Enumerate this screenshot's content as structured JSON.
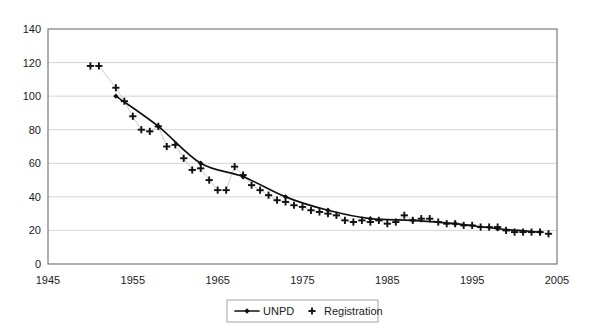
{
  "chart_data": {
    "type": "line",
    "title": "",
    "subtitle": "",
    "xlabel": "",
    "ylabel": "",
    "xlim": [
      1945,
      2005
    ],
    "ylim": [
      0,
      140
    ],
    "xticks": [
      1945,
      1955,
      1965,
      1975,
      1985,
      1995,
      2005
    ],
    "yticks": [
      0,
      20,
      40,
      60,
      80,
      100,
      120,
      140
    ],
    "grid": "horizontal",
    "legend_position": "bottom-center",
    "series": [
      {
        "name": "UNPD",
        "marker": "filled-diamond-line",
        "x": [
          1953,
          1958,
          1963,
          1968,
          1973,
          1978,
          1983,
          1988,
          1993,
          1998,
          2003
        ],
        "values": [
          100,
          82,
          60,
          52,
          40,
          32,
          27,
          26,
          24,
          21,
          19
        ]
      },
      {
        "name": "Registration",
        "marker": "plus",
        "x": [
          1950,
          1951,
          1953,
          1954,
          1955,
          1956,
          1957,
          1958,
          1959,
          1960,
          1961,
          1962,
          1963,
          1964,
          1965,
          1966,
          1967,
          1968,
          1969,
          1970,
          1971,
          1972,
          1973,
          1974,
          1975,
          1976,
          1977,
          1978,
          1979,
          1980,
          1981,
          1982,
          1983,
          1984,
          1985,
          1986,
          1987,
          1988,
          1989,
          1990,
          1991,
          1992,
          1993,
          1994,
          1995,
          1996,
          1997,
          1998,
          1999,
          2000,
          2001,
          2002,
          2003,
          2004
        ],
        "values": [
          118,
          118,
          105,
          97,
          88,
          80,
          79,
          82,
          70,
          71,
          63,
          56,
          57,
          50,
          44,
          44,
          58,
          53,
          47,
          44,
          41,
          38,
          37,
          35,
          34,
          32,
          31,
          30,
          29,
          26,
          25,
          26,
          25,
          26,
          24,
          25,
          29,
          26,
          27,
          27,
          25,
          24,
          24,
          23,
          23,
          22,
          22,
          22,
          20,
          19,
          19,
          19,
          19,
          18
        ]
      }
    ]
  },
  "legend": {
    "items": [
      {
        "label": "UNPD",
        "marker": "line-with-diamond"
      },
      {
        "label": "Registration",
        "marker": "plus"
      }
    ]
  },
  "axes": {
    "y_tick_labels": [
      "140",
      "120",
      "100",
      "80",
      "60",
      "40",
      "20",
      "0"
    ],
    "x_tick_labels": [
      "1945",
      "1955",
      "1965",
      "1975",
      "1985",
      "1995",
      "2005"
    ]
  },
  "colors": {
    "line": "#111111",
    "grid": "#c9c9c9",
    "frame": "#6d6d6d",
    "text": "#1a1a1a",
    "background": "#ffffff"
  }
}
